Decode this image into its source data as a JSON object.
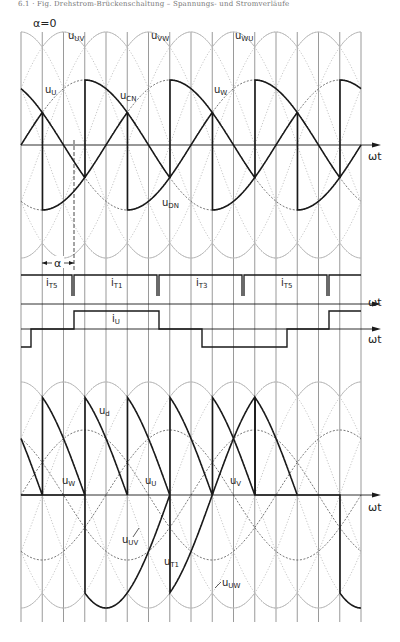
{
  "header": {
    "text": "6.1 · Fig. Drehstrom-Brückenschaltung – Spannungs- und Stromverläufe"
  },
  "colors": {
    "background": "#ffffff",
    "ink": "#1a1a1a",
    "grid": "#6e6e6e",
    "faint": "#b8b8b8",
    "dashed": "#555555"
  },
  "labels": {
    "alpha_zero": "α=0",
    "alpha": "α",
    "omega_t": "ωt",
    "u_UV": {
      "main": "u",
      "sub": "UV"
    },
    "u_VW": {
      "main": "u",
      "sub": "VW"
    },
    "u_WU": {
      "main": "u",
      "sub": "WU"
    },
    "u_U_top": {
      "main": "u",
      "sub": "U"
    },
    "u_CN": {
      "main": "u",
      "sub": "CN"
    },
    "u_W_top": {
      "main": "u",
      "sub": "W"
    },
    "u_DN": {
      "main": "u",
      "sub": "DN"
    },
    "i_T5_a": {
      "main": "i",
      "sub": "T5"
    },
    "i_T1": {
      "main": "i",
      "sub": "T1"
    },
    "i_T3": {
      "main": "i",
      "sub": "T3"
    },
    "i_T5_b": {
      "main": "i",
      "sub": "T5"
    },
    "i_U": {
      "main": "i",
      "sub": "U"
    },
    "u_d": {
      "main": "u",
      "sub": "d"
    },
    "u_W_bot": {
      "main": "u",
      "sub": "W"
    },
    "u_U_bot": {
      "main": "u",
      "sub": "U"
    },
    "u_V_bot": {
      "main": "u",
      "sub": "V"
    },
    "u_UV_bot": {
      "main": "u",
      "sub": "UV"
    },
    "u_T1": {
      "main": "u",
      "sub": "T1"
    },
    "u_UW": {
      "main": "u",
      "sub": "UW"
    }
  },
  "diagram": {
    "type": "three-phase fully controlled bridge (B6C) waveforms",
    "firing_angle_deg": 60,
    "grid": {
      "x_start_px": 21,
      "step_px": 21.25,
      "count": 17,
      "step_deg": 30
    },
    "panels": [
      {
        "name": "phase-voltages-uCN-uDN",
        "axis_y_px": 145,
        "axis_label": "ωt"
      },
      {
        "name": "thyristor-currents-iT",
        "axis_y_px": 293,
        "axis_label": "ωt",
        "pulses": [
          "iT5",
          "iT1",
          "iT3",
          "iT5"
        ]
      },
      {
        "name": "phase-current-iU",
        "axis_y_px": 329,
        "axis_label": "ωt"
      },
      {
        "name": "output-voltage-ud-uT1",
        "axis_y_px": 495,
        "axis_label": "ωt"
      }
    ]
  }
}
